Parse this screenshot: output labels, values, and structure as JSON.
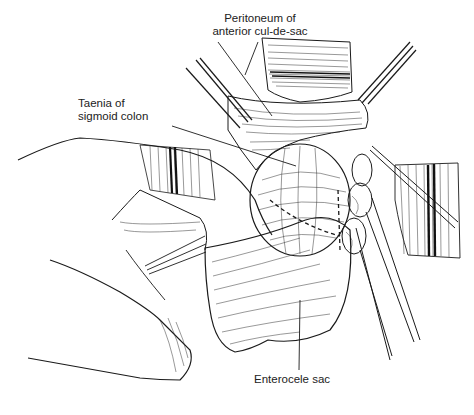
{
  "figure": {
    "type": "surgical line illustration",
    "labels": {
      "peritoneum_line1": "Peritoneum of",
      "peritoneum_line2": "anterior cul-de-sac",
      "taenia_line1": "Taenia of",
      "taenia_line2": "sigmoid colon",
      "enterocele": "Enterocele sac"
    },
    "colors": {
      "ink": "#1a1a1a",
      "background": "#ffffff",
      "label_text": "#222222"
    }
  }
}
